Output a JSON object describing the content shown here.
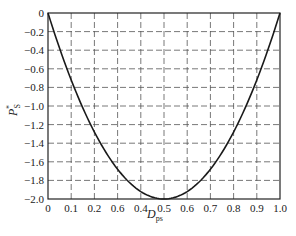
{
  "chart_data": {
    "type": "line",
    "title": "",
    "xlabel": "D_ps",
    "xlabel_main": "D",
    "xlabel_sub": "ps",
    "ylabel": "P_S*",
    "ylabel_main": "P",
    "ylabel_sub": "S",
    "ylabel_sup": "*",
    "xlim": [
      0,
      1.0
    ],
    "ylim": [
      -2.0,
      0
    ],
    "grid": true,
    "grid_style": "dashed",
    "x_ticks": [
      0,
      0.1,
      0.2,
      0.3,
      0.4,
      0.5,
      0.6,
      0.7,
      0.8,
      0.9,
      1.0
    ],
    "x_tick_labels": [
      "0",
      "0.1",
      "0.2",
      "0.6",
      "0.4",
      "0.5",
      "0.6",
      "0.7",
      "0.8",
      "0.9",
      "1.0"
    ],
    "y_ticks": [
      0,
      -0.2,
      -0.4,
      -0.6,
      -0.8,
      -1.0,
      -1.2,
      -1.4,
      -1.6,
      -1.8,
      -2.0
    ],
    "y_tick_labels": [
      "0",
      "-0.2",
      "-0.4",
      "-0.6",
      "-0.8",
      "-1.0",
      "-1.2",
      "-1.4",
      "-1.6",
      "-1.8",
      "-2.0"
    ],
    "series": [
      {
        "name": "P_S*",
        "color": "#1a1a1a",
        "x": [
          0,
          0.05,
          0.1,
          0.15,
          0.2,
          0.25,
          0.3,
          0.35,
          0.4,
          0.45,
          0.5,
          0.55,
          0.6,
          0.65,
          0.7,
          0.75,
          0.8,
          0.85,
          0.9,
          0.95,
          1.0
        ],
        "y": [
          0,
          -0.38,
          -0.72,
          -1.02,
          -1.28,
          -1.5,
          -1.68,
          -1.82,
          -1.92,
          -1.98,
          -2.0,
          -1.98,
          -1.92,
          -1.82,
          -1.68,
          -1.5,
          -1.28,
          -1.02,
          -0.72,
          -0.38,
          0
        ]
      }
    ]
  }
}
